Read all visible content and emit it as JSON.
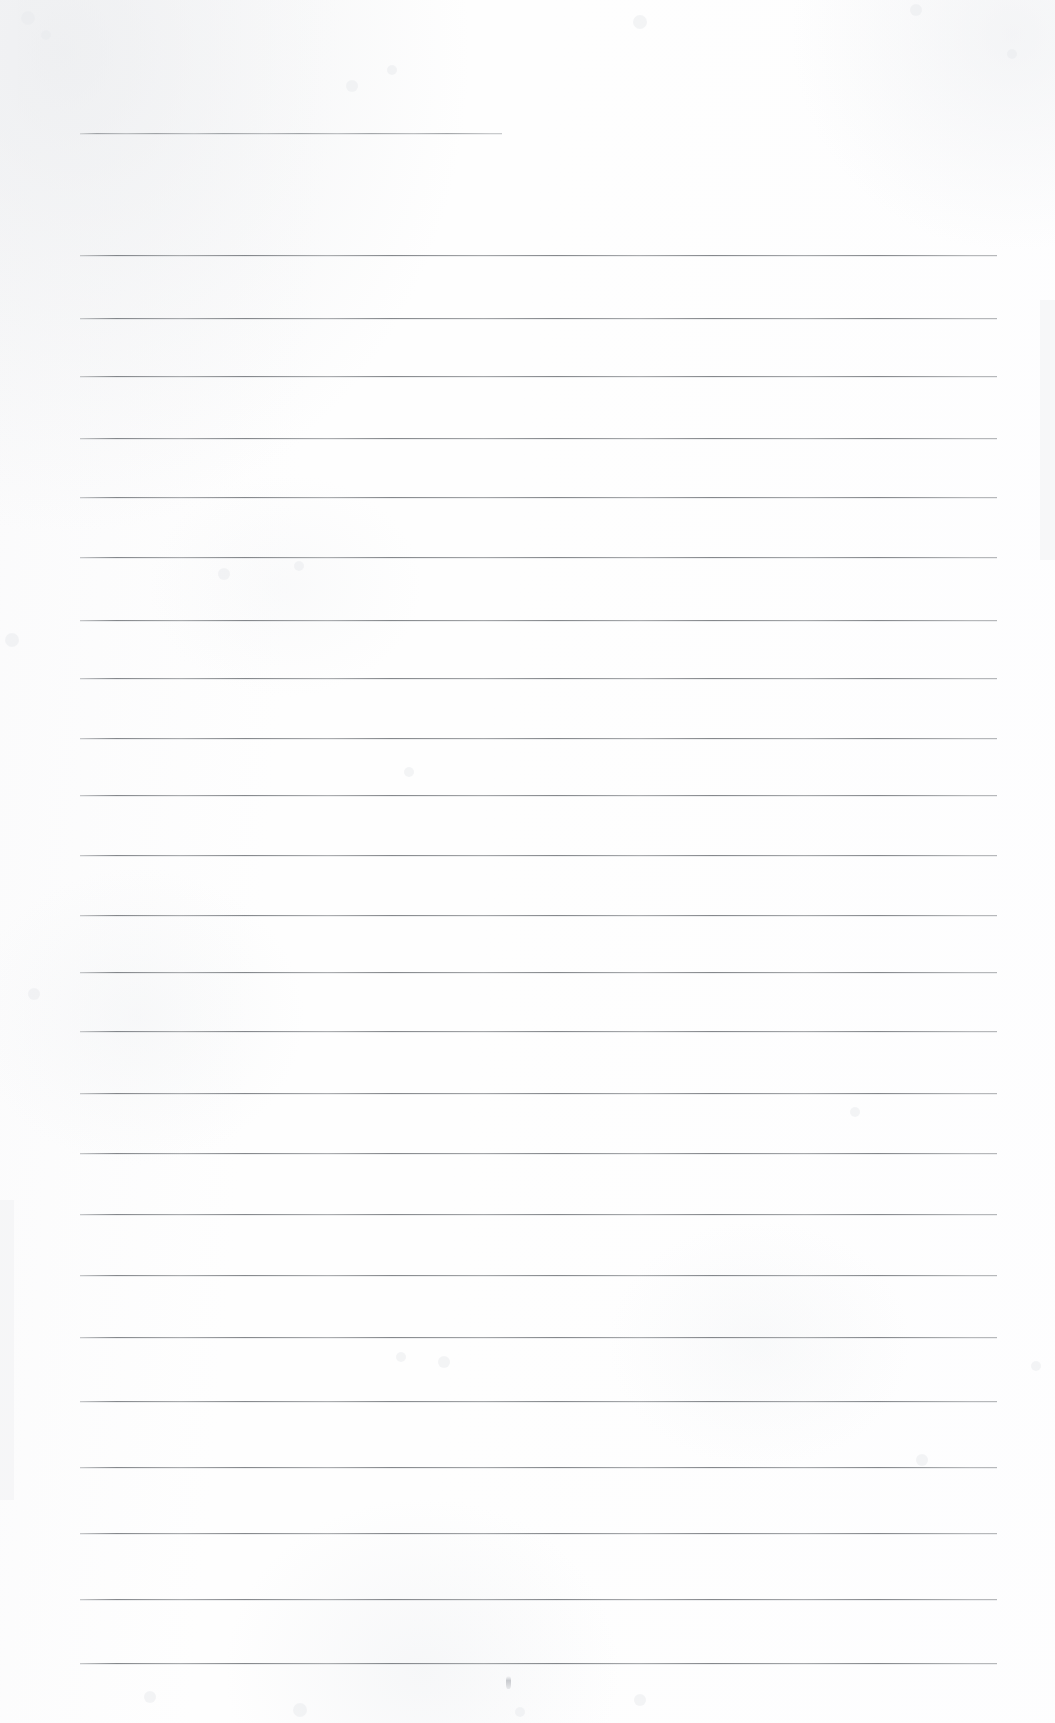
{
  "document": {
    "kind": "scanned-ruled-notebook-page",
    "title": "Blank Ruled Page",
    "page_width": 1055,
    "page_height": 1723,
    "background_color": "#fefefe",
    "rule_color": "#565a60",
    "text_content": "",
    "visible_text": [],
    "notes": "Scanned blank lined paper — no printed or handwritten text is present."
  },
  "layout": {
    "left_margin_x": 80,
    "right_margin_x": 997,
    "short_rule_right_x": 502,
    "first_rule_y": 133,
    "body_first_rule_y": 255,
    "rule_spacing": 66,
    "rule_count_total": 23
  },
  "rules": [
    {
      "name": "heading-rule",
      "x": 80,
      "y": 133,
      "width": 422,
      "variant": "short"
    },
    {
      "name": "body-rule-1",
      "x": 80,
      "y": 255,
      "width": 917,
      "variant": "full"
    },
    {
      "name": "body-rule-2",
      "x": 80,
      "y": 318,
      "width": 917,
      "variant": "full"
    },
    {
      "name": "body-rule-3",
      "x": 80,
      "y": 376,
      "width": 917,
      "variant": "full"
    },
    {
      "name": "body-rule-4",
      "x": 80,
      "y": 438,
      "width": 917,
      "variant": "full"
    },
    {
      "name": "body-rule-5",
      "x": 80,
      "y": 497,
      "width": 917,
      "variant": "full"
    },
    {
      "name": "body-rule-6",
      "x": 80,
      "y": 557,
      "width": 917,
      "variant": "full"
    },
    {
      "name": "body-rule-7",
      "x": 80,
      "y": 620,
      "width": 917,
      "variant": "full"
    },
    {
      "name": "body-rule-8",
      "x": 80,
      "y": 678,
      "width": 917,
      "variant": "full"
    },
    {
      "name": "body-rule-9",
      "x": 80,
      "y": 738,
      "width": 917,
      "variant": "full"
    },
    {
      "name": "body-rule-10",
      "x": 80,
      "y": 795,
      "width": 917,
      "variant": "full"
    },
    {
      "name": "body-rule-11",
      "x": 80,
      "y": 855,
      "width": 917,
      "variant": "full"
    },
    {
      "name": "body-rule-12",
      "x": 80,
      "y": 915,
      "width": 917,
      "variant": "full"
    },
    {
      "name": "body-rule-13",
      "x": 80,
      "y": 972,
      "width": 917,
      "variant": "full"
    },
    {
      "name": "body-rule-14",
      "x": 80,
      "y": 1031,
      "width": 917,
      "variant": "full"
    },
    {
      "name": "body-rule-15",
      "x": 80,
      "y": 1093,
      "width": 917,
      "variant": "full"
    },
    {
      "name": "body-rule-16",
      "x": 80,
      "y": 1153,
      "width": 917,
      "variant": "full"
    },
    {
      "name": "body-rule-17",
      "x": 80,
      "y": 1214,
      "width": 917,
      "variant": "full"
    },
    {
      "name": "body-rule-18",
      "x": 80,
      "y": 1275,
      "width": 917,
      "variant": "full"
    },
    {
      "name": "body-rule-19",
      "x": 80,
      "y": 1337,
      "width": 917,
      "variant": "full"
    },
    {
      "name": "body-rule-20",
      "x": 80,
      "y": 1401,
      "width": 917,
      "variant": "full"
    },
    {
      "name": "body-rule-21",
      "x": 80,
      "y": 1467,
      "width": 917,
      "variant": "full"
    },
    {
      "name": "body-rule-22",
      "x": 80,
      "y": 1533,
      "width": 917,
      "variant": "full"
    },
    {
      "name": "body-rule-23",
      "x": 80,
      "y": 1599,
      "width": 917,
      "variant": "full"
    },
    {
      "name": "body-rule-24",
      "x": 80,
      "y": 1663,
      "width": 917,
      "variant": "full"
    }
  ],
  "marks": [
    {
      "name": "ink-speck",
      "x": 506,
      "y": 1676
    }
  ]
}
